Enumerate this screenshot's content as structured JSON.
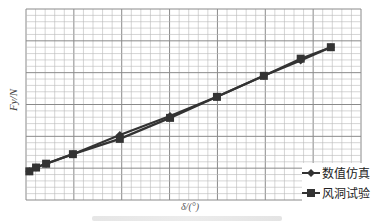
{
  "chart_data": {
    "type": "line",
    "title": "",
    "xlabel": "δ/(°)",
    "ylabel": "F_y/N",
    "grid": true,
    "x_tick_labels_visible": false,
    "y_tick_labels_visible": false,
    "legend_position": "lower right",
    "units_note": "No numeric tick labels shown; values below are normalized plot coordinates (x: 0–100 across plot width, y: 0–100 up plot height).",
    "series": [
      {
        "name": "数值仿真",
        "marker": "diamond",
        "color": "#333333",
        "x": [
          1,
          3,
          6,
          14,
          28,
          43,
          57,
          71,
          82,
          91
        ],
        "y": [
          15,
          17,
          19,
          24,
          34,
          44,
          54,
          65,
          73,
          80
        ]
      },
      {
        "name": "风洞试验",
        "marker": "square",
        "color": "#333333",
        "x": [
          1,
          3,
          6,
          14,
          28,
          43,
          57,
          71,
          82,
          91
        ],
        "y": [
          15,
          17,
          19,
          24,
          32,
          43,
          54,
          65,
          74,
          80
        ]
      }
    ]
  },
  "axes": {
    "xlabel": "δ/(°)",
    "ylabel": "Fy/N"
  },
  "legend": {
    "items": [
      {
        "label": "数值仿真",
        "icon": "diamond-marker-icon"
      },
      {
        "label": "风洞试验",
        "icon": "square-marker-icon"
      }
    ]
  },
  "colors": {
    "grid_minor": "#b8b8b8",
    "grid_major": "#8a8a8a",
    "line": "#333333"
  }
}
